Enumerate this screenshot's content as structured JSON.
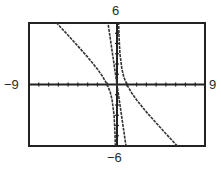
{
  "chart_data": {
    "type": "line",
    "title": "",
    "xlabel": "",
    "ylabel": "",
    "window": {
      "xmin": -9,
      "xmax": 9,
      "ymin": -6,
      "ymax": 6
    },
    "xlim": [
      -9,
      9
    ],
    "ylim": [
      -6,
      6
    ],
    "xscl": 1,
    "yscl": 1,
    "tick_labels": {
      "xmin": "−9",
      "xmax": "9",
      "ymin": "−6",
      "ymax": "6"
    },
    "grid": false,
    "legend": null,
    "series": [
      {
        "name": "curve-1 (rational, slant asymptote y = -x, vertical asymptote x = 0)",
        "expression": "y = -x + 1/x",
        "x_intercepts": [
          -1,
          1
        ],
        "points": [
          [
            -7.6,
            7.47
          ],
          [
            -7.0,
            6.86
          ],
          [
            -6.0,
            5.83
          ],
          [
            -5.0,
            4.8
          ],
          [
            -4.0,
            3.75
          ],
          [
            -3.0,
            2.67
          ],
          [
            -2.0,
            1.5
          ],
          [
            -1.5,
            0.83
          ],
          [
            -1.0,
            0.0
          ],
          [
            -0.7,
            -0.73
          ],
          [
            -0.5,
            -1.5
          ],
          [
            -0.3,
            -3.03
          ],
          [
            -0.2,
            -4.8
          ],
          [
            -0.16,
            -6.09
          ],
          [
            0.16,
            6.09
          ],
          [
            0.2,
            4.8
          ],
          [
            0.3,
            3.03
          ],
          [
            0.5,
            1.5
          ],
          [
            0.7,
            0.73
          ],
          [
            1.0,
            0.0
          ],
          [
            1.5,
            -0.83
          ],
          [
            2.0,
            -1.5
          ],
          [
            3.0,
            -2.67
          ],
          [
            4.0,
            -3.75
          ],
          [
            5.0,
            -4.8
          ],
          [
            6.0,
            -5.83
          ],
          [
            7.6,
            -7.47
          ]
        ]
      },
      {
        "name": "curve-2 (steep line through origin)",
        "expression": "y ≈ -6.5x",
        "points": [
          [
            -0.95,
            6.2
          ],
          [
            0.0,
            0.0
          ],
          [
            0.95,
            -6.2
          ]
        ]
      }
    ]
  },
  "frame": {
    "stroke": "#222222"
  },
  "colors": {
    "curve": "#333333",
    "axis": "#222222",
    "background": "#ffffff"
  }
}
